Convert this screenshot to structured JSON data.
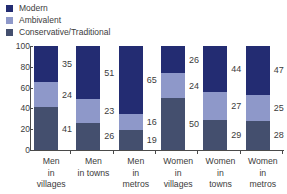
{
  "legend": {
    "items": [
      {
        "label": "Modern",
        "color": "#232c72",
        "swatch_name": "legend-swatch-modern"
      },
      {
        "label": "Ambivalent",
        "color": "#8e98c9",
        "swatch_name": "legend-swatch-ambivalent"
      },
      {
        "label": "Conservative/Traditional",
        "color": "#444f6e",
        "swatch_name": "legend-swatch-conservative"
      }
    ]
  },
  "axes": {
    "y_ticks": [
      "100",
      "80",
      "60",
      "40",
      "20",
      "0"
    ],
    "y_tick_values": [
      100,
      80,
      60,
      40,
      20,
      0
    ]
  },
  "chart_data": {
    "type": "bar",
    "title": "",
    "subtitle": "",
    "xlabel": "",
    "ylabel": "",
    "ylim": [
      0,
      100
    ],
    "grid": false,
    "stacked": true,
    "stack_total": 100,
    "legend_position": "top-left",
    "categories": [
      "Men in villages",
      "Men in towns",
      "Men in metros",
      "Women in villages",
      "Women in towns",
      "Women in metros"
    ],
    "category_lines": [
      [
        "Men",
        "in",
        "villages"
      ],
      [
        "Men",
        "in towns",
        ""
      ],
      [
        "Men",
        "in",
        "metros"
      ],
      [
        "Women",
        "in",
        "villages"
      ],
      [
        "Women",
        "in",
        "towns"
      ],
      [
        "Women",
        "in",
        "metros"
      ]
    ],
    "series": [
      {
        "name": "Modern",
        "color": "#232c72",
        "values": [
          35,
          51,
          65,
          26,
          44,
          47
        ]
      },
      {
        "name": "Ambivalent",
        "color": "#8e98c9",
        "values": [
          24,
          23,
          16,
          24,
          27,
          25
        ]
      },
      {
        "name": "Conservative/Traditional",
        "color": "#444f6e",
        "values": [
          41,
          26,
          19,
          50,
          29,
          28
        ]
      }
    ],
    "ytick_labels": [
      "0",
      "20",
      "40",
      "60",
      "80",
      "100"
    ]
  }
}
